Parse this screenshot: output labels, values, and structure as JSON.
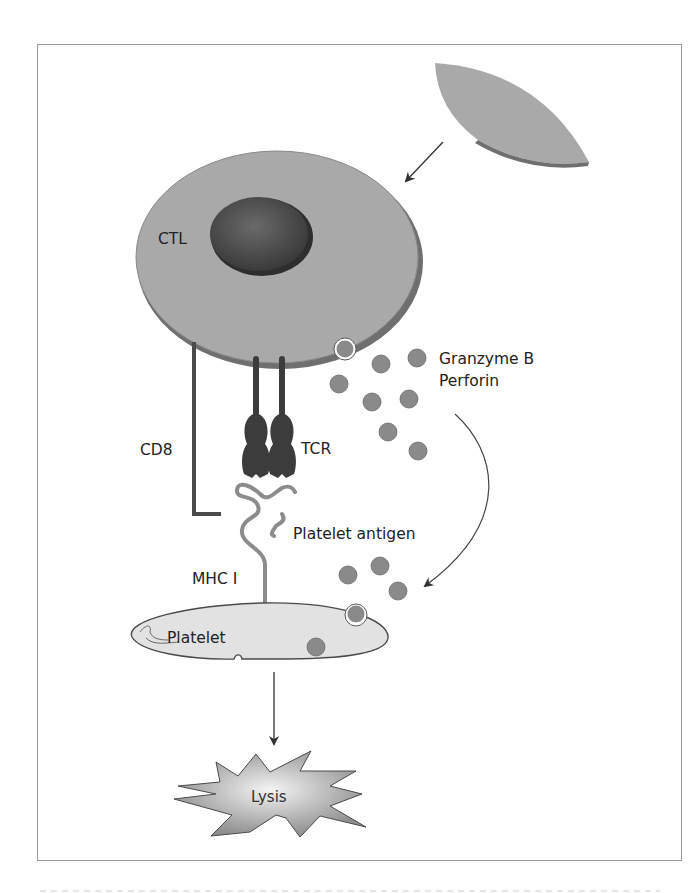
{
  "figure": {
    "labels": {
      "ctl": "CTL",
      "granzyme": "Granzyme B",
      "perforin": "Perforin",
      "cd8": "CD8",
      "tcr": "TCR",
      "platelet_antigen": "Platelet antigen",
      "mhc": "MHC I",
      "platelet": "Platelet",
      "lysis": "Lysis"
    },
    "colors": {
      "cell_fill": "#a9a9a9",
      "cell_shadow": "#6f6f6f",
      "nucleus": "#4a4a4a",
      "granule": "#8a8a8a",
      "receptor": "#3c3c3c",
      "mhc": "#8c8c8c",
      "platelet_fill": "#e2e2e2",
      "frame": "#9a9a9a"
    },
    "granules": [
      {
        "x": 381,
        "y": 364
      },
      {
        "x": 417,
        "y": 358
      },
      {
        "x": 339,
        "y": 384
      },
      {
        "x": 372,
        "y": 402
      },
      {
        "x": 409,
        "y": 399
      },
      {
        "x": 388,
        "y": 432
      },
      {
        "x": 418,
        "y": 451
      },
      {
        "x": 348,
        "y": 575
      },
      {
        "x": 380,
        "y": 566
      },
      {
        "x": 398,
        "y": 591
      }
    ]
  }
}
